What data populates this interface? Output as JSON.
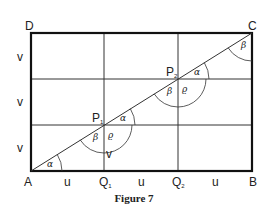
{
  "figure": {
    "caption": "Figure 7",
    "vertices": {
      "A": "A",
      "B": "B",
      "C": "C",
      "D": "D"
    },
    "points": {
      "P1": "P",
      "P1_sub": "1",
      "P2": "P",
      "P2_sub": "2",
      "Q1": "Q",
      "Q1_sub": "1",
      "Q2": "Q",
      "Q2_sub": "2"
    },
    "side_labels": {
      "bottom": [
        "u",
        "u",
        "u"
      ],
      "left": [
        "v",
        "v",
        "v"
      ]
    },
    "inner_label_v": "v",
    "angles": {
      "alpha": "α",
      "beta": "β",
      "rho": "ϱ"
    }
  }
}
